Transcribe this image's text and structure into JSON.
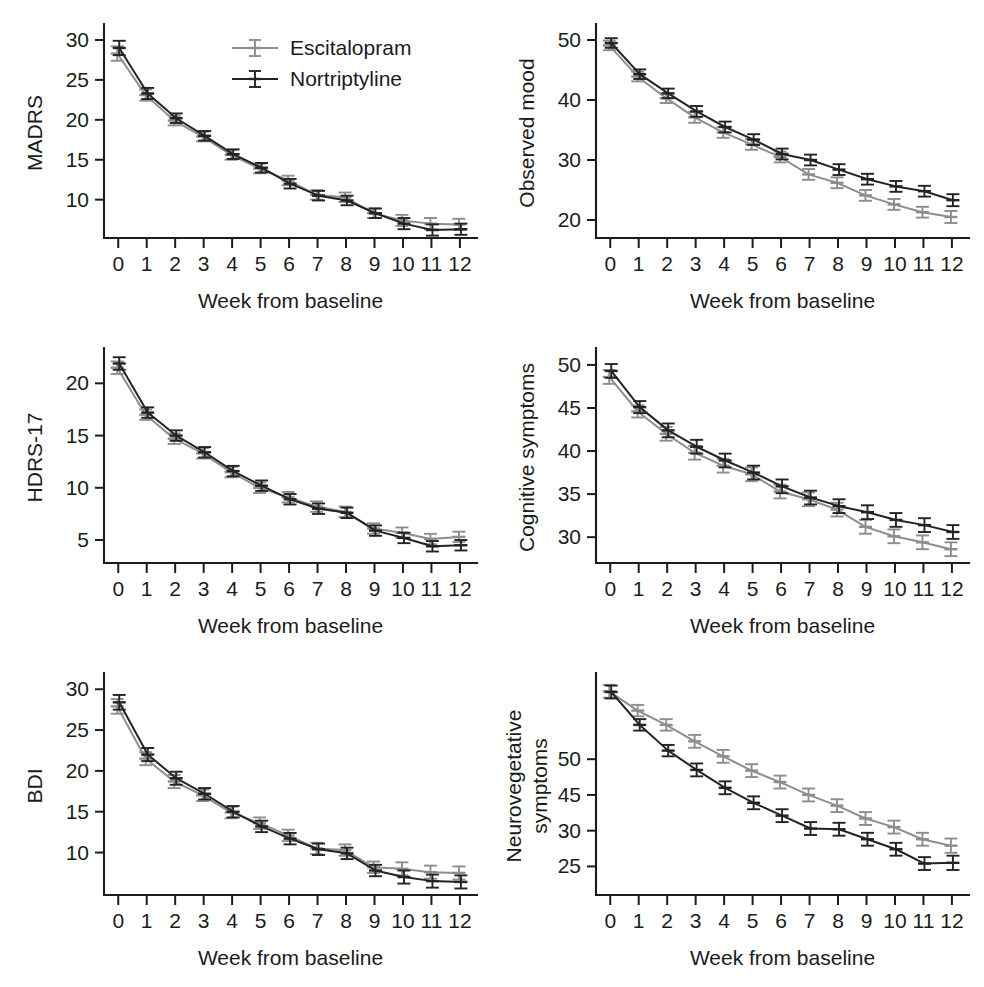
{
  "figure": {
    "legend": {
      "position": "top-left-panel",
      "entries": [
        {
          "label": "Escitalopram",
          "color": "#8d8d8d"
        },
        {
          "label": "Nortriptyline",
          "color": "#232323"
        }
      ]
    },
    "shared_xlabel": "Week from baseline",
    "colors": {
      "escitalopram": "#8d8d8d",
      "nortriptyline": "#232323",
      "axis": "#1c1c1c"
    }
  },
  "chart_data": [
    {
      "id": "madrs",
      "type": "line",
      "panel": "top-left",
      "title": "",
      "xlabel": "Week from baseline",
      "ylabel": "MADRS",
      "x": [
        0,
        1,
        2,
        3,
        4,
        5,
        6,
        7,
        8,
        9,
        10,
        11,
        12
      ],
      "xticks": [
        0,
        1,
        2,
        3,
        4,
        5,
        6,
        7,
        8,
        9,
        10,
        11,
        12
      ],
      "xlim": [
        -0.5,
        12.6
      ],
      "yticks": [
        10,
        15,
        20,
        25,
        30
      ],
      "ylim": [
        5.2,
        31.5
      ],
      "grid": false,
      "errorbars": "standard error",
      "series": [
        {
          "name": "Escitalopram",
          "color": "#8d8d8d",
          "values": [
            28.3,
            23.1,
            19.9,
            17.9,
            15.6,
            13.9,
            12.4,
            10.6,
            10.3,
            8.3,
            7.4,
            7.0,
            6.9
          ],
          "errors": [
            0.9,
            0.7,
            0.6,
            0.6,
            0.6,
            0.6,
            0.6,
            0.6,
            0.6,
            0.6,
            0.7,
            0.7,
            0.7
          ]
        },
        {
          "name": "Nortriptyline",
          "color": "#232323",
          "values": [
            29.0,
            23.3,
            20.2,
            18.0,
            15.7,
            14.0,
            12.0,
            10.5,
            9.9,
            8.3,
            7.0,
            6.2,
            6.3
          ],
          "errors": [
            0.9,
            0.7,
            0.6,
            0.6,
            0.6,
            0.6,
            0.6,
            0.6,
            0.6,
            0.6,
            0.7,
            0.7,
            0.7
          ]
        }
      ]
    },
    {
      "id": "observed-mood",
      "type": "line",
      "panel": "top-right",
      "title": "",
      "xlabel": "Week from baseline",
      "ylabel": "Observed mood",
      "x": [
        0,
        1,
        2,
        3,
        4,
        5,
        6,
        7,
        8,
        9,
        10,
        11,
        12
      ],
      "xticks": [
        0,
        1,
        2,
        3,
        4,
        5,
        6,
        7,
        8,
        9,
        10,
        11,
        12
      ],
      "xlim": [
        -0.5,
        12.6
      ],
      "yticks": [
        20,
        30,
        40,
        50
      ],
      "ylim": [
        17.0,
        52.0
      ],
      "grid": false,
      "errorbars": "standard error",
      "series": [
        {
          "name": "Escitalopram",
          "color": "#8d8d8d",
          "values": [
            49.1,
            43.9,
            40.3,
            37.1,
            34.6,
            32.6,
            30.5,
            27.6,
            26.2,
            24.1,
            22.6,
            21.3,
            20.5
          ],
          "errors": [
            0.8,
            0.8,
            0.8,
            0.9,
            0.9,
            0.9,
            0.9,
            0.9,
            0.9,
            0.9,
            0.9,
            0.9,
            1.0
          ]
        },
        {
          "name": "Nortriptyline",
          "color": "#232323",
          "values": [
            49.5,
            44.3,
            41.1,
            38.1,
            35.5,
            33.4,
            31.0,
            30.0,
            28.4,
            26.8,
            25.6,
            24.8,
            23.3
          ],
          "errors": [
            0.8,
            0.8,
            0.8,
            0.9,
            0.9,
            0.9,
            0.9,
            0.9,
            0.9,
            0.9,
            0.9,
            0.9,
            1.0
          ]
        }
      ]
    },
    {
      "id": "hdrs-17",
      "type": "line",
      "panel": "middle-left",
      "title": "",
      "xlabel": "Week from baseline",
      "ylabel": "HDRS-17",
      "x": [
        0,
        1,
        2,
        3,
        4,
        5,
        6,
        7,
        8,
        9,
        10,
        11,
        12
      ],
      "xticks": [
        0,
        1,
        2,
        3,
        4,
        5,
        6,
        7,
        8,
        9,
        10,
        11,
        12
      ],
      "xlim": [
        -0.5,
        12.6
      ],
      "yticks": [
        5,
        10,
        15,
        20
      ],
      "ylim": [
        2.8,
        23.0
      ],
      "grid": false,
      "errorbars": "standard error",
      "series": [
        {
          "name": "Escitalopram",
          "color": "#8d8d8d",
          "values": [
            21.5,
            17.0,
            14.7,
            13.3,
            11.5,
            10.0,
            9.1,
            8.2,
            7.7,
            6.1,
            5.7,
            5.1,
            5.3
          ],
          "errors": [
            0.6,
            0.5,
            0.5,
            0.5,
            0.5,
            0.5,
            0.5,
            0.5,
            0.5,
            0.5,
            0.5,
            0.5,
            0.5
          ]
        },
        {
          "name": "Nortriptyline",
          "color": "#232323",
          "values": [
            21.9,
            17.2,
            15.0,
            13.4,
            11.6,
            10.2,
            8.9,
            8.0,
            7.6,
            5.9,
            5.2,
            4.4,
            4.5
          ],
          "errors": [
            0.6,
            0.5,
            0.5,
            0.5,
            0.5,
            0.5,
            0.5,
            0.5,
            0.5,
            0.5,
            0.5,
            0.5,
            0.5
          ]
        }
      ]
    },
    {
      "id": "cognitive-symptoms",
      "type": "line",
      "panel": "middle-right",
      "title": "",
      "xlabel": "Week from baseline",
      "ylabel": "Cognitive symptoms",
      "x": [
        0,
        1,
        2,
        3,
        4,
        5,
        6,
        7,
        8,
        9,
        10,
        11,
        12
      ],
      "xticks": [
        0,
        1,
        2,
        3,
        4,
        5,
        6,
        7,
        8,
        9,
        10,
        11,
        12
      ],
      "xlim": [
        -0.5,
        12.6
      ],
      "yticks": [
        30,
        35,
        40,
        45,
        50
      ],
      "ylim": [
        27.0,
        51.5
      ],
      "grid": false,
      "errorbars": "standard error",
      "series": [
        {
          "name": "Escitalopram",
          "color": "#8d8d8d",
          "values": [
            48.6,
            44.6,
            42.0,
            39.8,
            38.3,
            37.3,
            35.3,
            34.4,
            33.2,
            31.2,
            30.1,
            29.4,
            28.6
          ],
          "errors": [
            0.8,
            0.7,
            0.8,
            0.8,
            0.8,
            0.8,
            0.8,
            0.8,
            0.8,
            0.8,
            0.8,
            0.8,
            0.8
          ]
        },
        {
          "name": "Nortriptyline",
          "color": "#232323",
          "values": [
            49.3,
            45.1,
            42.4,
            40.5,
            38.9,
            37.5,
            35.9,
            34.6,
            33.6,
            32.9,
            32.0,
            31.4,
            30.6
          ],
          "errors": [
            0.8,
            0.7,
            0.8,
            0.8,
            0.8,
            0.8,
            0.8,
            0.8,
            0.8,
            0.8,
            0.8,
            0.8,
            0.8
          ]
        }
      ]
    },
    {
      "id": "bdi",
      "type": "line",
      "panel": "bottom-left",
      "title": "",
      "xlabel": "Week from baseline",
      "ylabel": "BDI",
      "x": [
        0,
        1,
        2,
        3,
        4,
        5,
        6,
        7,
        8,
        9,
        10,
        11,
        12
      ],
      "xticks": [
        0,
        1,
        2,
        3,
        4,
        5,
        6,
        7,
        8,
        9,
        10,
        11,
        12
      ],
      "xlim": [
        -0.5,
        12.6
      ],
      "yticks": [
        10,
        15,
        20,
        25,
        30
      ],
      "ylim": [
        4.8,
        31.5
      ],
      "grid": false,
      "errorbars": "standard error",
      "series": [
        {
          "name": "Escitalopram",
          "color": "#8d8d8d",
          "values": [
            27.9,
            21.5,
            18.7,
            17.0,
            14.9,
            13.6,
            12.1,
            10.5,
            10.3,
            8.2,
            8.0,
            7.6,
            7.5
          ],
          "errors": [
            0.9,
            0.8,
            0.8,
            0.7,
            0.7,
            0.7,
            0.7,
            0.7,
            0.7,
            0.7,
            0.8,
            0.8,
            0.8
          ]
        },
        {
          "name": "Nortriptyline",
          "color": "#232323",
          "values": [
            28.4,
            22.0,
            19.1,
            17.2,
            15.0,
            13.2,
            11.7,
            10.4,
            9.9,
            7.8,
            7.0,
            6.5,
            6.4
          ],
          "errors": [
            0.9,
            0.8,
            0.8,
            0.7,
            0.7,
            0.7,
            0.7,
            0.7,
            0.7,
            0.7,
            0.8,
            0.8,
            0.8
          ]
        }
      ]
    },
    {
      "id": "neurovegetative-symptoms",
      "type": "line",
      "panel": "bottom-right",
      "title": "",
      "xlabel": "Week from baseline",
      "ylabel": "Neurovegetative symptoms",
      "ylabel_lines": [
        "Neurovegetative",
        "symptoms"
      ],
      "x": [
        0,
        1,
        2,
        3,
        4,
        5,
        6,
        7,
        8,
        9,
        10,
        11,
        12
      ],
      "xticks": [
        0,
        1,
        2,
        3,
        4,
        5,
        6,
        7,
        8,
        9,
        10,
        11,
        12
      ],
      "xlim": [
        -0.5,
        12.6
      ],
      "yticks": [
        25,
        30,
        45,
        50
      ],
      "ytick_positions": [
        25,
        30,
        35,
        40
      ],
      "ylim": [
        21.0,
        51.5
      ],
      "grid": false,
      "errorbars": "standard error",
      "note": "y tick labels as printed in the source figure: 50, 45, 30, 25",
      "series": [
        {
          "name": "Escitalopram",
          "color": "#8d8d8d",
          "values": [
            49.5,
            46.8,
            44.8,
            42.5,
            40.4,
            38.4,
            36.8,
            35.0,
            33.5,
            31.7,
            30.5,
            28.8,
            27.9
          ],
          "errors": [
            0.9,
            0.8,
            0.8,
            0.9,
            0.9,
            0.9,
            0.9,
            0.9,
            0.9,
            0.9,
            0.9,
            0.9,
            1.0
          ]
        },
        {
          "name": "Nortriptyline",
          "color": "#232323",
          "values": [
            49.4,
            44.8,
            41.2,
            38.5,
            36.0,
            33.9,
            32.1,
            30.3,
            30.2,
            28.8,
            27.4,
            25.4,
            25.5
          ],
          "errors": [
            0.9,
            0.8,
            0.8,
            0.9,
            0.9,
            0.9,
            0.9,
            0.9,
            0.9,
            0.9,
            0.9,
            0.9,
            1.0
          ]
        }
      ]
    }
  ]
}
